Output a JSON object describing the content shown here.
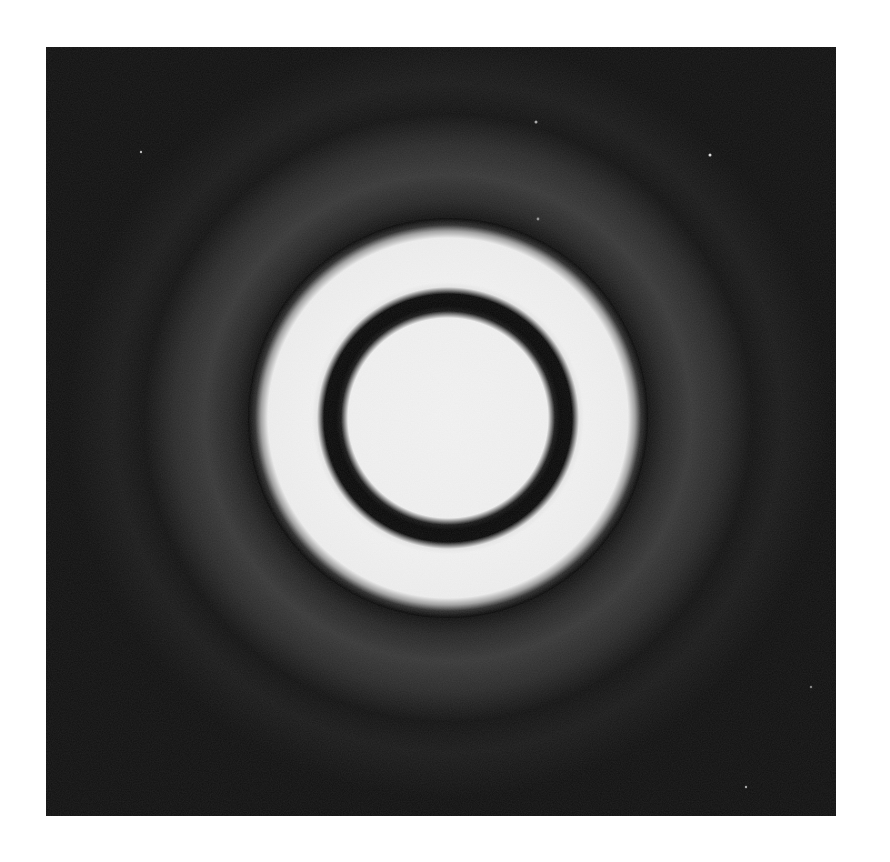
{
  "image": {
    "description": "Black-and-white photograph of a circular diffraction pattern (Airy-type rings): bright central disc, thin dark ring, bright annulus, and faint grey outer halo on a dark background",
    "background_color": "#070707",
    "pattern": {
      "center": [
        402,
        371
      ],
      "central_disc": {
        "radius": 108,
        "color": "#f2f2f2"
      },
      "first_dark_ring": {
        "inner_radius": 108,
        "outer_radius": 130,
        "color": "#0a0a0a"
      },
      "bright_annulus": {
        "inner_radius": 130,
        "outer_radius": 188,
        "color": "#f0f0f0"
      },
      "dark_gap": {
        "inner_radius": 188,
        "outer_radius": 215,
        "color": "#080808"
      },
      "outer_halo": {
        "inner_radius": 215,
        "outer_radius": 300,
        "color": "#3a3a3a"
      }
    }
  }
}
